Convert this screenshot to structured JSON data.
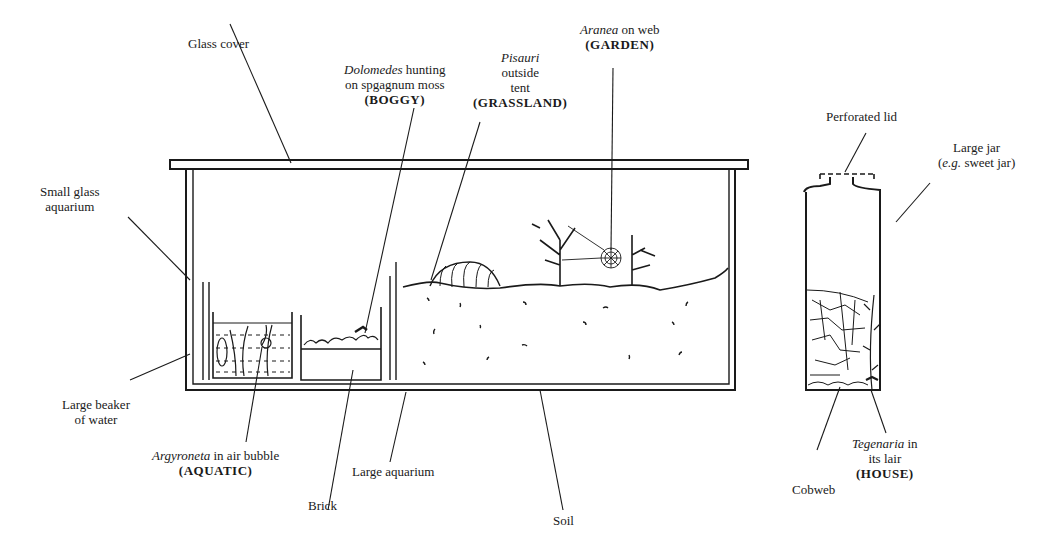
{
  "labels": {
    "glass_cover": "Glass cover",
    "small_aquarium": {
      "line1": "Small glass",
      "line2": "aquarium"
    },
    "large_beaker": {
      "line1": "Large beaker",
      "line2": "of water"
    },
    "argyroneta": {
      "species": "Argyroneta",
      "desc": " in air bubble",
      "habitat": "(AQUATIC)"
    },
    "brick": "Brick",
    "large_aquarium": "Large aquarium",
    "soil": "Soil",
    "dolomedes": {
      "species": "Dolomedes",
      "desc1": " hunting",
      "desc2": "on spgagnum moss",
      "habitat": "(BOGGY)"
    },
    "pisauri": {
      "species": "Pisauri",
      "desc1": "outside",
      "desc2": "tent",
      "habitat": "(GRASSLAND)"
    },
    "aranea": {
      "species": "Aranea",
      "desc": " on web",
      "habitat": "(GARDEN)"
    },
    "perforated_lid": "Perforated lid",
    "large_jar": {
      "line1": "Large jar",
      "eg": "e.g.",
      "line2": " sweet jar)",
      "open": "("
    },
    "cobweb": "Cobweb",
    "tegenaria": {
      "species": "Tegenaria",
      "desc1": " in",
      "desc2": "its lair",
      "habitat": "(HOUSE)"
    }
  }
}
